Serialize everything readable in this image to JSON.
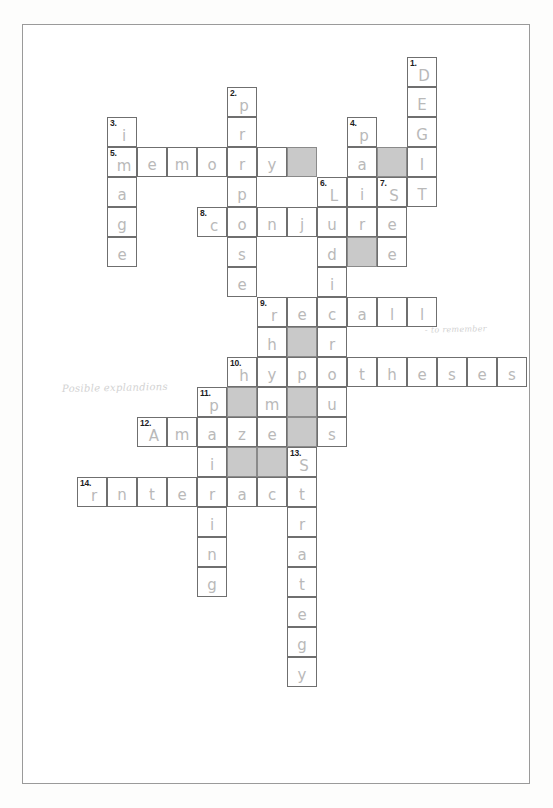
{
  "puzzle": {
    "title": "Psychology memory crossword puzzle",
    "grid": {
      "cols": 14,
      "rows": 20,
      "cell_size": 30,
      "origin_x": 47,
      "origin_y": 57
    },
    "colors": {
      "cell_border": "#6f6f6f",
      "cell_fill": "#ffffff",
      "shaded_fill": "#c9c9c9",
      "letter_ink": "#b9b9b9",
      "number_ink": "#1d1d1d",
      "paper_border": "#9a9a9a"
    },
    "cells": [
      {
        "num": "1.",
        "letter": "D",
        "col": 12,
        "row": 0,
        "shaded": false
      },
      {
        "num": "",
        "letter": "E",
        "col": 12,
        "row": 1,
        "shaded": false
      },
      {
        "num": "",
        "letter": "G",
        "col": 12,
        "row": 2,
        "shaded": false
      },
      {
        "num": "2.",
        "letter": "p",
        "col": 6,
        "row": 1,
        "shaded": false
      },
      {
        "num": "",
        "letter": "r",
        "col": 6,
        "row": 2,
        "shaded": false
      },
      {
        "num": "3.",
        "letter": "i",
        "col": 2,
        "row": 2,
        "shaded": false
      },
      {
        "num": "4.",
        "letter": "p",
        "col": 10,
        "row": 2,
        "shaded": false
      },
      {
        "num": "5.",
        "letter": "m",
        "col": 2,
        "row": 3,
        "shaded": false
      },
      {
        "num": "",
        "letter": "e",
        "col": 3,
        "row": 3,
        "shaded": false
      },
      {
        "num": "",
        "letter": "m",
        "col": 4,
        "row": 3,
        "shaded": false
      },
      {
        "num": "",
        "letter": "o",
        "col": 5,
        "row": 3,
        "shaded": false
      },
      {
        "num": "",
        "letter": "r",
        "col": 6,
        "row": 3,
        "shaded": false
      },
      {
        "num": "",
        "letter": "y",
        "col": 7,
        "row": 3,
        "shaded": false
      },
      {
        "num": "",
        "letter": "",
        "col": 8,
        "row": 3,
        "shaded": true
      },
      {
        "num": "",
        "letter": "a",
        "col": 10,
        "row": 3,
        "shaded": false
      },
      {
        "num": "",
        "letter": "",
        "col": 11,
        "row": 3,
        "shaded": true
      },
      {
        "num": "",
        "letter": "I",
        "col": 12,
        "row": 3,
        "shaded": false
      },
      {
        "num": "",
        "letter": "a",
        "col": 2,
        "row": 4,
        "shaded": false
      },
      {
        "num": "",
        "letter": "p",
        "col": 6,
        "row": 4,
        "shaded": false
      },
      {
        "num": "6.",
        "letter": "L",
        "col": 9,
        "row": 4,
        "shaded": false
      },
      {
        "num": "",
        "letter": "i",
        "col": 10,
        "row": 4,
        "shaded": false
      },
      {
        "num": "7.",
        "letter": "S",
        "col": 11,
        "row": 4,
        "shaded": false
      },
      {
        "num": "",
        "letter": "T",
        "col": 12,
        "row": 4,
        "shaded": false
      },
      {
        "num": "",
        "letter": "g",
        "col": 2,
        "row": 5,
        "shaded": false
      },
      {
        "num": "8.",
        "letter": "c",
        "col": 5,
        "row": 5,
        "shaded": false
      },
      {
        "num": "",
        "letter": "o",
        "col": 6,
        "row": 5,
        "shaded": false
      },
      {
        "num": "",
        "letter": "n",
        "col": 7,
        "row": 5,
        "shaded": false
      },
      {
        "num": "",
        "letter": "j",
        "col": 8,
        "row": 5,
        "shaded": false
      },
      {
        "num": "",
        "letter": "u",
        "col": 9,
        "row": 5,
        "shaded": false
      },
      {
        "num": "",
        "letter": "r",
        "col": 10,
        "row": 5,
        "shaded": false
      },
      {
        "num": "",
        "letter": "e",
        "col": 11,
        "row": 5,
        "shaded": false
      },
      {
        "num": "",
        "letter": "e",
        "col": 2,
        "row": 6,
        "shaded": false
      },
      {
        "num": "",
        "letter": "s",
        "col": 6,
        "row": 6,
        "shaded": false
      },
      {
        "num": "",
        "letter": "d",
        "col": 9,
        "row": 6,
        "shaded": false
      },
      {
        "num": "",
        "letter": "",
        "col": 10,
        "row": 6,
        "shaded": true
      },
      {
        "num": "",
        "letter": "e",
        "col": 11,
        "row": 6,
        "shaded": false
      },
      {
        "num": "",
        "letter": "e",
        "col": 6,
        "row": 7,
        "shaded": false
      },
      {
        "num": "",
        "letter": "i",
        "col": 9,
        "row": 7,
        "shaded": false
      },
      {
        "num": "9.",
        "letter": "r",
        "col": 7,
        "row": 8,
        "shaded": false
      },
      {
        "num": "",
        "letter": "e",
        "col": 8,
        "row": 8,
        "shaded": false
      },
      {
        "num": "",
        "letter": "c",
        "col": 9,
        "row": 8,
        "shaded": false
      },
      {
        "num": "",
        "letter": "a",
        "col": 10,
        "row": 8,
        "shaded": false
      },
      {
        "num": "",
        "letter": "l",
        "col": 11,
        "row": 8,
        "shaded": false
      },
      {
        "num": "",
        "letter": "l",
        "col": 12,
        "row": 8,
        "shaded": false
      },
      {
        "num": "",
        "letter": "h",
        "col": 7,
        "row": 9,
        "shaded": false
      },
      {
        "num": "",
        "letter": "",
        "col": 8,
        "row": 9,
        "shaded": true
      },
      {
        "num": "",
        "letter": "r",
        "col": 9,
        "row": 9,
        "shaded": false
      },
      {
        "num": "10.",
        "letter": "h",
        "col": 6,
        "row": 10,
        "shaded": false
      },
      {
        "num": "",
        "letter": "y",
        "col": 7,
        "row": 10,
        "shaded": false
      },
      {
        "num": "",
        "letter": "p",
        "col": 8,
        "row": 10,
        "shaded": false
      },
      {
        "num": "",
        "letter": "o",
        "col": 9,
        "row": 10,
        "shaded": false
      },
      {
        "num": "",
        "letter": "t",
        "col": 10,
        "row": 10,
        "shaded": false
      },
      {
        "num": "",
        "letter": "h",
        "col": 11,
        "row": 10,
        "shaded": false
      },
      {
        "num": "",
        "letter": "e",
        "col": 12,
        "row": 10,
        "shaded": false
      },
      {
        "num": "",
        "letter": "s",
        "col": 13,
        "row": 10,
        "shaded": false
      },
      {
        "num": "",
        "letter": "e",
        "col": 14,
        "row": 10,
        "shaded": false
      },
      {
        "num": "",
        "letter": "s",
        "col": 15,
        "row": 10,
        "shaded": false
      },
      {
        "num": "11.",
        "letter": "p",
        "col": 5,
        "row": 11,
        "shaded": false
      },
      {
        "num": "",
        "letter": "",
        "col": 6,
        "row": 11,
        "shaded": true
      },
      {
        "num": "",
        "letter": "m",
        "col": 7,
        "row": 11,
        "shaded": false
      },
      {
        "num": "",
        "letter": "",
        "col": 8,
        "row": 11,
        "shaded": true
      },
      {
        "num": "",
        "letter": "u",
        "col": 9,
        "row": 11,
        "shaded": false
      },
      {
        "num": "12.",
        "letter": "A",
        "col": 3,
        "row": 12,
        "shaded": false
      },
      {
        "num": "",
        "letter": "m",
        "col": 4,
        "row": 12,
        "shaded": false
      },
      {
        "num": "",
        "letter": "a",
        "col": 5,
        "row": 12,
        "shaded": false
      },
      {
        "num": "",
        "letter": "z",
        "col": 6,
        "row": 12,
        "shaded": false
      },
      {
        "num": "",
        "letter": "e",
        "col": 7,
        "row": 12,
        "shaded": false
      },
      {
        "num": "",
        "letter": "",
        "col": 8,
        "row": 12,
        "shaded": true
      },
      {
        "num": "",
        "letter": "s",
        "col": 9,
        "row": 12,
        "shaded": false
      },
      {
        "num": "",
        "letter": "i",
        "col": 5,
        "row": 13,
        "shaded": false
      },
      {
        "num": "",
        "letter": "",
        "col": 6,
        "row": 13,
        "shaded": true
      },
      {
        "num": "",
        "letter": "",
        "col": 7,
        "row": 13,
        "shaded": true
      },
      {
        "num": "13.",
        "letter": "S",
        "col": 8,
        "row": 13,
        "shaded": false
      },
      {
        "num": "14.",
        "letter": "r",
        "col": 1,
        "row": 14,
        "shaded": false
      },
      {
        "num": "",
        "letter": "n",
        "col": 2,
        "row": 14,
        "shaded": false
      },
      {
        "num": "",
        "letter": "t",
        "col": 3,
        "row": 14,
        "shaded": false
      },
      {
        "num": "",
        "letter": "e",
        "col": 4,
        "row": 14,
        "shaded": false
      },
      {
        "num": "",
        "letter": "r",
        "col": 5,
        "row": 14,
        "shaded": false
      },
      {
        "num": "",
        "letter": "a",
        "col": 6,
        "row": 14,
        "shaded": false
      },
      {
        "num": "",
        "letter": "c",
        "col": 7,
        "row": 14,
        "shaded": false
      },
      {
        "num": "",
        "letter": "t",
        "col": 8,
        "row": 14,
        "shaded": false
      },
      {
        "num": "",
        "letter": "i",
        "col": 5,
        "row": 15,
        "shaded": false
      },
      {
        "num": "",
        "letter": "r",
        "col": 8,
        "row": 15,
        "shaded": false
      },
      {
        "num": "",
        "letter": "n",
        "col": 5,
        "row": 16,
        "shaded": false
      },
      {
        "num": "",
        "letter": "a",
        "col": 8,
        "row": 16,
        "shaded": false
      },
      {
        "num": "",
        "letter": "g",
        "col": 5,
        "row": 17,
        "shaded": false
      },
      {
        "num": "",
        "letter": "t",
        "col": 8,
        "row": 17,
        "shaded": false
      },
      {
        "num": "",
        "letter": "e",
        "col": 8,
        "row": 18,
        "shaded": false
      },
      {
        "num": "",
        "letter": "g",
        "col": 8,
        "row": 19,
        "shaded": false
      },
      {
        "num": "",
        "letter": "y",
        "col": 8,
        "row": 20,
        "shaded": false
      }
    ],
    "annotations": {
      "left_note": "Posible explandions",
      "right_note": "- to remember"
    },
    "answers": {
      "across": [
        {
          "number": "5",
          "word": "memory"
        },
        {
          "number": "6",
          "word": "Li S T"
        },
        {
          "number": "8",
          "word": "conjure"
        },
        {
          "number": "9",
          "word": "recall"
        },
        {
          "number": "10",
          "word": "hypotheses"
        },
        {
          "number": "12",
          "word": "Amaze"
        },
        {
          "number": "14",
          "word": "rnteract"
        }
      ],
      "down": [
        {
          "number": "1",
          "word": "DEGIT"
        },
        {
          "number": "2",
          "word": "propose"
        },
        {
          "number": "3",
          "word": "image"
        },
        {
          "number": "4",
          "word": "pair"
        },
        {
          "number": "6",
          "word": "Ludicr"
        },
        {
          "number": "7",
          "word": "See"
        },
        {
          "number": "9",
          "word": "rhyme"
        },
        {
          "number": "11",
          "word": "pairing"
        },
        {
          "number": "13",
          "word": "Strategy"
        }
      ]
    }
  }
}
